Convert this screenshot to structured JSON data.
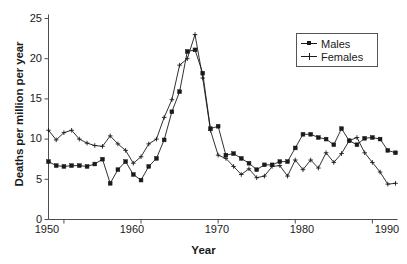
{
  "chart_data": {
    "type": "line",
    "title": "",
    "xlabel": "Year",
    "ylabel": "Deaths per million per year",
    "xlim": [
      1948,
      1993
    ],
    "ylim": [
      0,
      25
    ],
    "yticks": [
      0,
      5,
      10,
      15,
      20,
      25
    ],
    "xticks": [
      1950,
      1960,
      1970,
      1980,
      1990
    ],
    "grid": false,
    "legend_position": "upper-right",
    "x": [
      1948,
      1949,
      1950,
      1951,
      1952,
      1953,
      1954,
      1955,
      1956,
      1957,
      1958,
      1959,
      1960,
      1961,
      1962,
      1963,
      1964,
      1965,
      1966,
      1967,
      1968,
      1969,
      1970,
      1971,
      1972,
      1973,
      1974,
      1975,
      1976,
      1977,
      1978,
      1979,
      1980,
      1981,
      1982,
      1983,
      1984,
      1985,
      1986,
      1987,
      1988,
      1989,
      1990,
      1991,
      1992,
      1993
    ],
    "series": [
      {
        "name": "Males",
        "marker": "square",
        "values": [
          7.2,
          6.7,
          6.6,
          6.7,
          6.7,
          6.6,
          6.9,
          7.5,
          4.5,
          6.2,
          7.2,
          5.6,
          4.9,
          6.6,
          7.6,
          9.9,
          13.4,
          15.9,
          20.9,
          21.1,
          18.2,
          11.3,
          11.6,
          8.0,
          8.2,
          7.6,
          7.0,
          6.2,
          6.8,
          6.8,
          7.2,
          7.2,
          8.9,
          10.6,
          10.6,
          10.2,
          10.0,
          9.3,
          11.3,
          9.8,
          9.3,
          10.1,
          10.2,
          10.0,
          8.6,
          8.3
        ]
      },
      {
        "name": "Females",
        "marker": "plus",
        "values": [
          11.1,
          9.9,
          10.8,
          11.1,
          10.0,
          9.5,
          9.2,
          9.1,
          10.4,
          9.4,
          8.6,
          7.0,
          7.8,
          9.4,
          10.0,
          12.7,
          14.9,
          19.2,
          20.0,
          23.0,
          17.6,
          11.1,
          8.0,
          7.6,
          6.6,
          5.6,
          6.3,
          5.2,
          5.4,
          6.6,
          6.7,
          5.4,
          7.4,
          6.2,
          7.4,
          6.4,
          8.3,
          7.1,
          8.2,
          9.8,
          10.2,
          8.3,
          7.1,
          5.9,
          4.4,
          4.5
        ]
      }
    ]
  },
  "axes": {
    "y_tick_labels": [
      "0",
      "5",
      "10",
      "15",
      "20",
      "25"
    ],
    "x_tick_labels": [
      "1950",
      "1960",
      "1970",
      "1980",
      "1990"
    ],
    "y_title": "Deaths per million per year",
    "x_title": "Year"
  },
  "legend": {
    "items": [
      {
        "label": "Males"
      },
      {
        "label": "Females"
      }
    ]
  },
  "colors": {
    "line": "#1a1a1a",
    "axis": "#4d4d4d",
    "background": "#ffffff",
    "legend_border": "#555555"
  }
}
